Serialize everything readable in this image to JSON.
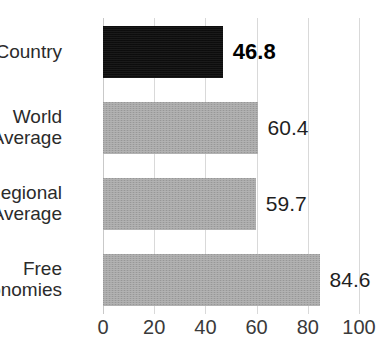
{
  "chart_data": {
    "type": "bar",
    "orientation": "horizontal",
    "title": "",
    "xlabel": "",
    "ylabel": "",
    "xlim": [
      0,
      100
    ],
    "grid": true,
    "legend": false,
    "categories": [
      "Country",
      "World Average",
      "Regional Average",
      "Free Economies"
    ],
    "values": [
      46.8,
      60.4,
      59.7,
      84.6
    ],
    "value_labels": [
      "46.8",
      "60.4",
      "59.7",
      "84.6"
    ],
    "xticks": [
      0,
      20,
      40,
      60,
      80,
      100
    ],
    "xtick_labels": [
      "0",
      "20",
      "40",
      "60",
      "80",
      "100"
    ],
    "bar_colors": [
      "#0d0d0d",
      "#a9a9a9",
      "#a9a9a9",
      "#a9a9a9"
    ],
    "highlight_index": 0
  },
  "rows": [
    {
      "label_line1": "Country",
      "label_line2": "",
      "value": "46.8",
      "pct": 46.8,
      "dark": true,
      "bold": true
    },
    {
      "label_line1": "World",
      "label_line2": "Average",
      "value": "60.4",
      "pct": 60.4,
      "dark": false,
      "bold": false
    },
    {
      "label_line1": "Regional",
      "label_line2": "Average",
      "value": "59.7",
      "pct": 59.7,
      "dark": false,
      "bold": false
    },
    {
      "label_line1": "Free",
      "label_line2": "Economies",
      "value": "84.6",
      "pct": 84.6,
      "dark": false,
      "bold": false
    }
  ],
  "axis": {
    "ticks": [
      "0",
      "20",
      "40",
      "60",
      "80",
      "100"
    ],
    "tick_values": [
      0,
      20,
      40,
      60,
      80,
      100
    ]
  },
  "colors": {
    "bar_gray": "#a9a9a9",
    "bar_black": "#0d0d0d",
    "gridline": "#d9d9d9",
    "text": "#231f20"
  }
}
